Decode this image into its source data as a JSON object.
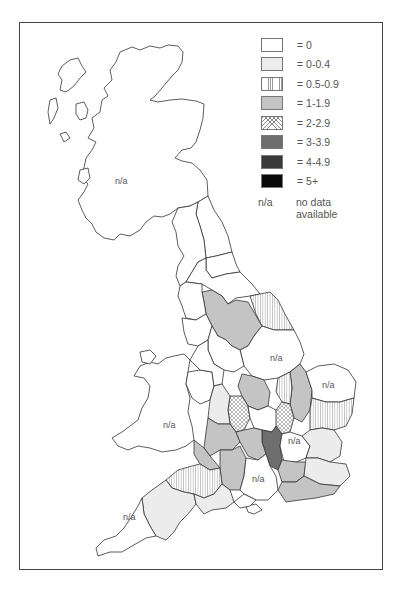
{
  "legend": {
    "items": [
      {
        "label": "= 0",
        "pattern": "white",
        "color": "#ffffff"
      },
      {
        "label": "= 0-0.4",
        "pattern": "light-grey",
        "color": "#ececec"
      },
      {
        "label": "= 0.5-0.9",
        "pattern": "vertical-hatch",
        "color": "#999999"
      },
      {
        "label": "= 1-1.9",
        "pattern": "mid-grey",
        "color": "#c4c4c4"
      },
      {
        "label": "= 2-2.9",
        "pattern": "cross-hatch",
        "color": "#888888"
      },
      {
        "label": "= 3-3.9",
        "pattern": "dark-grey",
        "color": "#6e6e6e"
      },
      {
        "label": "= 4-4.9",
        "pattern": "very-dark-grey",
        "color": "#3a3a3a"
      },
      {
        "label": "= 5+",
        "pattern": "black",
        "color": "#0a0a0a"
      }
    ],
    "na_key": "n/a",
    "na_description": "no data available"
  },
  "map": {
    "na_labels": {
      "scotland": "n/a",
      "yorkshire_south": "n/a",
      "norfolk": "n/a",
      "wales": "n/a",
      "hertfordshire": "n/a",
      "hampshire": "n/a",
      "cornwall": "n/a"
    }
  }
}
